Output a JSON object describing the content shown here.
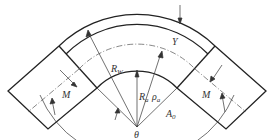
{
  "diagram": {
    "labels": {
      "outer_radius": "R",
      "outer_radius_sub": "W",
      "inner_radius": "R",
      "inner_radius_sub": "a",
      "mean_radius": "ρ",
      "mean_radius_sub": "a",
      "wall": "Y",
      "moment_left": "M",
      "moment_right": "M",
      "angle": "θ",
      "angle_a": "A",
      "angle_a_sub": "0"
    },
    "colors": {
      "line": "#222222",
      "text": "#333333"
    }
  }
}
